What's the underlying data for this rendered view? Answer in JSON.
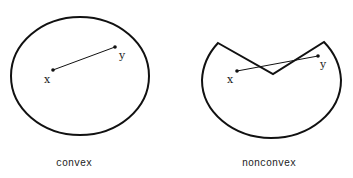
{
  "figures": [
    {
      "name": "convex",
      "caption": "convex",
      "point_labels": {
        "x": "x",
        "y": "y"
      }
    },
    {
      "name": "nonconvex",
      "caption": "nonconvex",
      "point_labels": {
        "x": "x",
        "y": "y"
      }
    }
  ],
  "colors": {
    "stroke": "#111111",
    "background": "#ffffff"
  }
}
